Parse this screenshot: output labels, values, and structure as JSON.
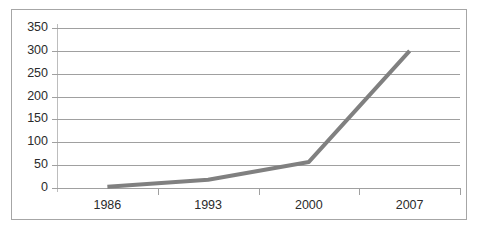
{
  "chart_data": {
    "type": "line",
    "title": "",
    "subtitle": "",
    "xlabel": "",
    "ylabel": "",
    "categories": [
      "1986",
      "1993",
      "2000",
      "2007"
    ],
    "series": [
      {
        "name": "",
        "values": [
          3,
          18,
          57,
          300
        ],
        "color": "#808080"
      }
    ],
    "x": [
      "1986",
      "1993",
      "2000",
      "2007"
    ],
    "values": [
      3,
      18,
      57,
      300
    ],
    "ylim": [
      0,
      350
    ],
    "ytick_labels": [
      "0",
      "50",
      "100",
      "150",
      "200",
      "250",
      "300",
      "350"
    ],
    "ytick_values": [
      0,
      50,
      100,
      150,
      200,
      250,
      300,
      350
    ],
    "ytick_step": 50,
    "grid": true,
    "grid_axis": "y",
    "legend": false,
    "legend_position": "none",
    "markers": false,
    "line_width": 4,
    "colors": {
      "series_line": "#808080",
      "gridline": "#a0a0a0",
      "axis": "#bdbdbd",
      "frame": "#a6a6a6",
      "text": "#2b2b2b",
      "background": "#ffffff"
    }
  }
}
